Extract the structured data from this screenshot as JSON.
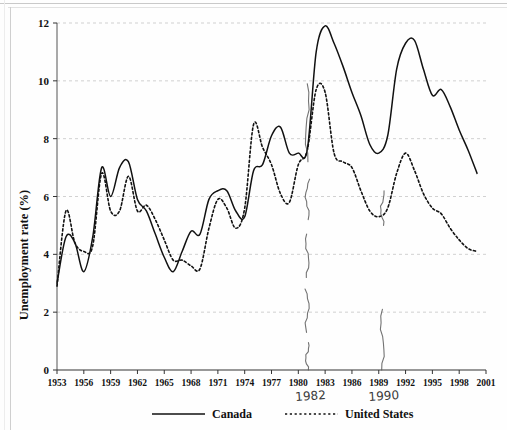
{
  "figure": {
    "background": "#ffffff",
    "ink": "#111111",
    "grid_color": "#cccccc",
    "annotation_color": "#3a3a3a"
  },
  "chart_data": {
    "type": "line",
    "title": "",
    "xlabel": "",
    "ylabel": "Unemployment rate (%)",
    "xlim": [
      1953,
      2001
    ],
    "ylim": [
      0,
      12
    ],
    "yticks": [
      0,
      2,
      4,
      6,
      8,
      10,
      12
    ],
    "xticks": [
      1953,
      1956,
      1959,
      1962,
      1965,
      1968,
      1971,
      1974,
      1977,
      1980,
      1983,
      1986,
      1989,
      1992,
      1995,
      1998,
      2001
    ],
    "grid": "horizontal-dashed",
    "legend_position": "bottom",
    "x": [
      1953,
      1954,
      1955,
      1956,
      1957,
      1958,
      1959,
      1960,
      1961,
      1962,
      1963,
      1964,
      1965,
      1966,
      1967,
      1968,
      1969,
      1970,
      1971,
      1972,
      1973,
      1974,
      1975,
      1976,
      1977,
      1978,
      1979,
      1980,
      1981,
      1982,
      1983,
      1984,
      1985,
      1986,
      1987,
      1988,
      1989,
      1990,
      1991,
      1992,
      1993,
      1994,
      1995,
      1996,
      1997,
      1998,
      1999,
      2000
    ],
    "series": [
      {
        "name": "Canada",
        "style": "solid",
        "color": "#111111",
        "values": [
          3.0,
          4.6,
          4.4,
          3.4,
          4.6,
          7.0,
          6.0,
          7.0,
          7.2,
          5.9,
          5.5,
          4.7,
          3.9,
          3.4,
          4.1,
          4.8,
          4.7,
          5.9,
          6.2,
          6.2,
          5.5,
          5.3,
          6.9,
          7.1,
          8.1,
          8.4,
          7.5,
          7.5,
          7.6,
          11.0,
          11.9,
          11.3,
          10.5,
          9.6,
          8.8,
          7.8,
          7.5,
          8.1,
          10.4,
          11.3,
          11.4,
          10.4,
          9.5,
          9.7,
          9.1,
          8.3,
          7.6,
          6.8
        ]
      },
      {
        "name": "United States",
        "style": "dotted",
        "color": "#111111",
        "values": [
          2.9,
          5.5,
          4.4,
          4.1,
          4.3,
          6.8,
          5.5,
          5.5,
          6.7,
          5.5,
          5.7,
          5.2,
          4.5,
          3.8,
          3.8,
          3.6,
          3.5,
          4.9,
          5.9,
          5.6,
          4.9,
          5.6,
          8.5,
          7.7,
          7.1,
          6.1,
          5.8,
          7.1,
          7.6,
          9.7,
          9.6,
          7.5,
          7.2,
          7.0,
          6.2,
          5.5,
          5.3,
          5.6,
          6.8,
          7.5,
          6.9,
          6.1,
          5.6,
          5.4,
          4.9,
          4.5,
          4.2,
          4.1
        ]
      }
    ],
    "annotations": [
      {
        "name": "handwritten-year-1982",
        "text": "1982",
        "x_year": 1981.4,
        "style": "handwritten"
      },
      {
        "name": "handwritten-year-1990",
        "text": "1990",
        "x_year": 1989.6,
        "style": "handwritten"
      },
      {
        "name": "handwritten-vline-1982",
        "type": "vertical-line",
        "x_year": 1981.0
      },
      {
        "name": "handwritten-vline-1990",
        "type": "vertical-line",
        "x_year": 1989.4
      }
    ]
  },
  "legend": {
    "items": [
      {
        "label": "Canada",
        "style": "solid"
      },
      {
        "label": "United States",
        "style": "dotted"
      }
    ]
  }
}
